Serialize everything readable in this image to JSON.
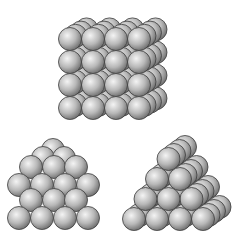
{
  "diagram": {
    "sphere": {
      "radius": 11.5,
      "fill_light": "#f4f4f4",
      "fill_mid": "#b8b8b8",
      "fill_dark": "#6a6a6a",
      "stroke": "#3c3c3c"
    },
    "background": "#ffffff",
    "structures": [
      {
        "name": "cubic-stack",
        "kind": "grid",
        "cols": 4,
        "rows": 4,
        "depth": 4,
        "origin": [
          70,
          108
        ],
        "dx": 23,
        "dy": -23,
        "depth_offset": [
          5.5,
          -3.2
        ]
      },
      {
        "name": "square-pyramid",
        "kind": "list",
        "spheres": [
          [
            19,
            218
          ],
          [
            42,
            218
          ],
          [
            65,
            218
          ],
          [
            88,
            218
          ],
          [
            31,
            200
          ],
          [
            54,
            200
          ],
          [
            76,
            200
          ],
          [
            19,
            185
          ],
          [
            42,
            185
          ],
          [
            65,
            185
          ],
          [
            88,
            185
          ],
          [
            31,
            167
          ],
          [
            54,
            167
          ],
          [
            76,
            167
          ],
          [
            43,
            158
          ],
          [
            64,
            158
          ],
          [
            53,
            150
          ]
        ],
        "draw_order_note": "back-to-front"
      },
      {
        "name": "triangular-prism-stack",
        "kind": "triangle",
        "rows": 4,
        "depth": 4,
        "origin": [
          134,
          219
        ],
        "dx": 23,
        "row_rise": 20,
        "depth_offset": [
          5.5,
          -4
        ]
      }
    ]
  }
}
